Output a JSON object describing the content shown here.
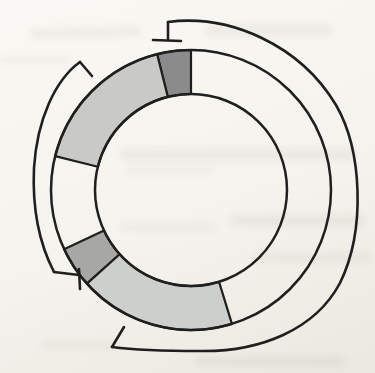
{
  "diagram": {
    "type": "circular-map",
    "line_color": "#1f1f1f",
    "ring": {
      "cx": 191,
      "cy": 190,
      "inner_radius": 96,
      "outer_radius": 140,
      "circle_stroke_width": 2.5,
      "segment_stroke_width": 2.2,
      "segments": [
        {
          "name": "segment-dark-top",
          "start_deg": 346,
          "end_deg": 360,
          "fill": "#8b8b8b"
        },
        {
          "name": "segment-light-upper-left",
          "start_deg": 284,
          "end_deg": 346,
          "fill": "#c9c9c6"
        },
        {
          "name": "segment-medium-lower-left",
          "start_deg": 228,
          "end_deg": 245,
          "fill": "#a7a7a4"
        },
        {
          "name": "segment-light-bottom",
          "start_deg": 163,
          "end_deg": 228,
          "fill": "#cdcfca"
        }
      ]
    },
    "brackets": [
      {
        "name": "outer-bracket-right",
        "stroke_width": 2.6,
        "path": "M 168,22 C 230,14 300,45 336,105 C 362,150 366,230 340,283 C 315,330 260,352 200,351 C 170,351 135,350 112,347",
        "terminators": [
          {
            "name": "blunt-end-tick-top",
            "path": "M 168,22 L 168,39"
          },
          {
            "name": "blunt-end-bar-top",
            "path": "M 153,40 L 181,41"
          },
          {
            "name": "tick-bottom",
            "path": "M 112,347 L 124,327"
          }
        ]
      },
      {
        "name": "outer-bracket-left",
        "stroke_width": 2.6,
        "path": "M 80,62 C 55,80 37,120 34,168 C 32,212 40,245 54,272",
        "terminators": [
          {
            "name": "tick-top",
            "path": "M 80,62 L 92,76"
          },
          {
            "name": "blunt-end-tick-bottom",
            "path": "M 54,272 L 79,275"
          },
          {
            "name": "blunt-end-bar-bottom",
            "path": "M 79,269 L 80,289"
          }
        ]
      }
    ]
  }
}
